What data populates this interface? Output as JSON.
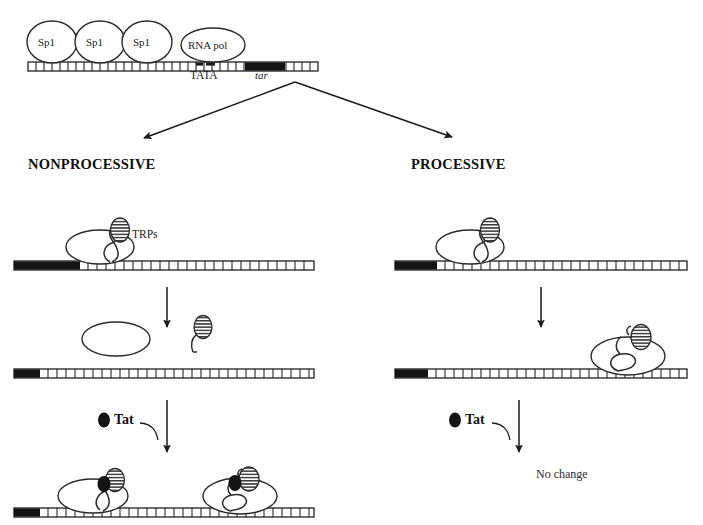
{
  "diagram": {
    "type": "molecular-biology-schematic"
  },
  "top_complex": {
    "proteins": [
      {
        "name": "Sp1",
        "label": "Sp1",
        "shape": "ellipse",
        "x": 52,
        "y": 42
      },
      {
        "name": "Sp1",
        "label": "Sp1",
        "shape": "ellipse",
        "x": 100,
        "y": 42
      },
      {
        "name": "Sp1",
        "label": "Sp1",
        "shape": "ellipse",
        "x": 147,
        "y": 42
      },
      {
        "name": "RNA polymerase",
        "label": "RNA pol",
        "shape": "ellipse",
        "x": 213,
        "y": 44
      }
    ],
    "dna_labels": [
      {
        "label": "TATA",
        "style": "normal",
        "x": 212,
        "y": 73
      },
      {
        "label": "tar",
        "style": "italic",
        "x": 271,
        "y": 73
      }
    ]
  },
  "branches": {
    "left_label": "NONPROCESSIVE",
    "right_label": "PROCESSIVE"
  },
  "annotations": {
    "trps_label": "TRPs",
    "tat_label": "Tat",
    "no_change_label": "No change"
  },
  "colors": {
    "ink": "#1a1a1a",
    "stroke": "#222222",
    "tar_block": "#111111",
    "tat_dot": "#111111",
    "background": "#ffffff",
    "hatch": "#333333"
  },
  "legend_semantics": {
    "filled_black_oval": "Tat protein",
    "hatched_oval": "TRPs (Tat-responsive / transcription regulatory proteins)",
    "open_ellipse": "RNA polymerase II",
    "segmented_bar": "DNA template",
    "solid_black_bar_segment": "tar element",
    "squiggly_line": "nascent RNA transcript"
  }
}
